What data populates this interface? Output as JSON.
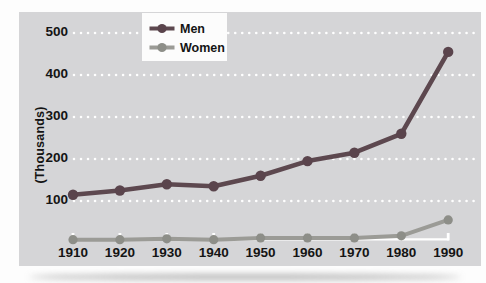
{
  "chart_data": {
    "type": "line",
    "title": "",
    "xlabel": "",
    "ylabel": "(Thousands)",
    "x": [
      1910,
      1920,
      1930,
      1940,
      1950,
      1960,
      1970,
      1980,
      1990
    ],
    "series": [
      {
        "name": "Men",
        "color": "#5d484f",
        "marker_color": "#5a444c",
        "values": [
          115,
          125,
          140,
          135,
          160,
          195,
          215,
          260,
          455
        ]
      },
      {
        "name": "Women",
        "color": "#9b9b96",
        "marker_color": "#8d8e88",
        "values": [
          8,
          8,
          10,
          8,
          12,
          12,
          12,
          17,
          55
        ]
      }
    ],
    "yticks_desc": [
      500,
      400,
      300,
      200,
      100
    ],
    "ylim": [
      0,
      550
    ],
    "grid": "horizontal white dotted lines at each y tick",
    "grid_color": "#ffffff",
    "baseline_color": "#ffffff",
    "legend_position": "top-center",
    "panel_background": "#d5d5d7",
    "text_color": "#141414"
  }
}
